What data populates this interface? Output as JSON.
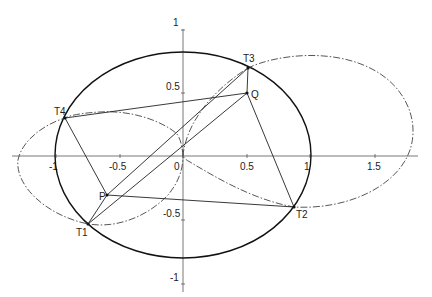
{
  "axes": {
    "x_ticks": [
      {
        "label": "-1",
        "value": -1
      },
      {
        "label": "-0.5",
        "value": -0.5
      },
      {
        "label": "0",
        "value": 0
      },
      {
        "label": "0.5",
        "value": 0.5
      },
      {
        "label": "1",
        "value": 1
      },
      {
        "label": "1.5",
        "value": 1.5
      }
    ],
    "y_ticks": [
      {
        "label": "1",
        "value": 1
      },
      {
        "label": "0.5",
        "value": 0.5
      },
      {
        "label": "-0.5",
        "value": -0.5
      },
      {
        "label": "-1",
        "value": -1
      }
    ]
  },
  "points": {
    "T1": {
      "label": "T1",
      "x": -0.75,
      "y": -0.53
    },
    "T2": {
      "label": "T2",
      "x": 0.87,
      "y": -0.4
    },
    "T3": {
      "label": "T3",
      "x": 0.51,
      "y": 0.69
    },
    "T4": {
      "label": "T4",
      "x": -0.93,
      "y": 0.3
    },
    "P": {
      "label": "P",
      "x": -0.6,
      "y": -0.31
    },
    "Q": {
      "label": "Q",
      "x": 0.5,
      "y": 0.5
    }
  },
  "curves": {
    "ellipse": {
      "style": "solid",
      "semi_major": 1,
      "semi_minor": 0.81,
      "center": [
        0,
        0
      ]
    },
    "pedal_left": {
      "style": "dash-dot",
      "through": [
        "T4",
        "T1",
        "origin"
      ]
    },
    "pedal_right": {
      "style": "dash-dot",
      "through": [
        "T3",
        "T2",
        "origin"
      ]
    }
  },
  "segments": [
    [
      "T4",
      "Q"
    ],
    [
      "T4",
      "P"
    ],
    [
      "T1",
      "P"
    ],
    [
      "P",
      "T3"
    ],
    [
      "T1",
      "Q"
    ],
    [
      "P",
      "T2"
    ],
    [
      "Q",
      "T2"
    ],
    [
      "T3",
      "Q"
    ]
  ]
}
